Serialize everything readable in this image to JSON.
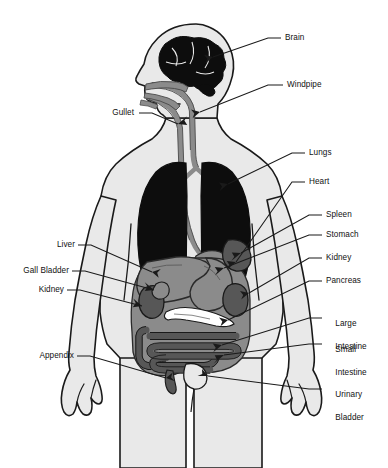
{
  "diagram": {
    "figure_type": "anatomical-diagram",
    "view": "anterior-body-with-profile-head",
    "background_color": "#ffffff",
    "body_fill_color": "#e9e9e9",
    "outline_color": "#1a1a1a",
    "organ_dark_color": "#0d0d0d",
    "organ_mid_color": "#8b8b8b",
    "organ_deep_color": "#575757",
    "label_text_color": "#111111",
    "leader_line_color": "#1a1a1a"
  },
  "labels": {
    "right": [
      {
        "id": "brain",
        "text": "Brain",
        "lines": [
          "Brain"
        ]
      },
      {
        "id": "windpipe",
        "text": "Windpipe",
        "lines": [
          "Windpipe"
        ]
      },
      {
        "id": "lungs",
        "text": "Lungs",
        "lines": [
          "Lungs"
        ]
      },
      {
        "id": "heart",
        "text": "Heart",
        "lines": [
          "Heart"
        ]
      },
      {
        "id": "spleen",
        "text": "Spleen",
        "lines": [
          "Spleen"
        ]
      },
      {
        "id": "stomach",
        "text": "Stomach",
        "lines": [
          "Stomach"
        ]
      },
      {
        "id": "kidney-right",
        "text": "Kidney",
        "lines": [
          "Kidney"
        ]
      },
      {
        "id": "pancreas",
        "text": "Pancreas",
        "lines": [
          "Pancreas"
        ]
      },
      {
        "id": "large-intestine",
        "text": "Large Intestine",
        "lines": [
          "Large",
          "Intestine"
        ]
      },
      {
        "id": "small-intestine",
        "text": "Small Intestine",
        "lines": [
          "Small",
          "Intestine"
        ]
      },
      {
        "id": "urinary-bladder",
        "text": "Urinary Bladder",
        "lines": [
          "Urinary",
          "Bladder"
        ]
      }
    ],
    "left": [
      {
        "id": "gullet",
        "text": "Gullet",
        "lines": [
          "Gullet"
        ]
      },
      {
        "id": "liver",
        "text": "Liver",
        "lines": [
          "Liver"
        ]
      },
      {
        "id": "gall-bladder",
        "text": "Gall Bladder",
        "lines": [
          "Gall Bladder"
        ]
      },
      {
        "id": "kidney-left",
        "text": "Kidney",
        "lines": [
          "Kidney"
        ]
      },
      {
        "id": "appendix",
        "text": "Appendix",
        "lines": [
          "Appendix"
        ]
      }
    ]
  },
  "organ_list": [
    "Brain",
    "Windpipe",
    "Gullet",
    "Lungs",
    "Heart",
    "Spleen",
    "Stomach",
    "Liver",
    "Gall Bladder",
    "Kidney",
    "Pancreas",
    "Large Intestine",
    "Small Intestine",
    "Appendix",
    "Urinary Bladder"
  ]
}
